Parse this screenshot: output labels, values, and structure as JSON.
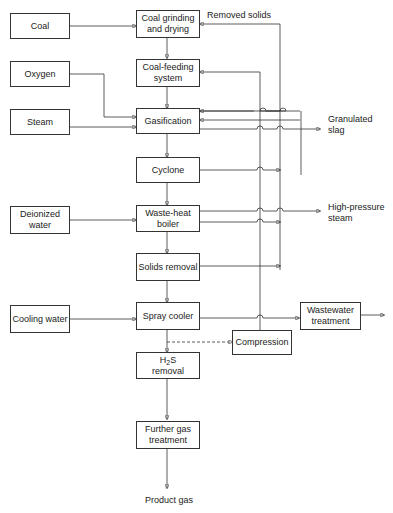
{
  "inputs": {
    "coal": "Coal",
    "oxygen": "Oxygen",
    "steam": "Steam",
    "deionized_water": "Deionized water",
    "cooling_water": "Cooling water"
  },
  "process": {
    "coal_grinding": "Coal grinding and drying",
    "coal_feeding": "Coal-feeding system",
    "gasification": "Gasification",
    "cyclone": "Cyclone",
    "waste_heat_boiler": "Waste-heat boiler",
    "solids_removal": "Solids removal",
    "spray_cooler": "Spray cooler",
    "h2s_removal_prefix": "H",
    "h2s_removal_sub": "2",
    "h2s_removal_suffix": "S",
    "h2s_removal_line2": "removal",
    "further_gas": "Further gas treatment",
    "compression": "Compression",
    "wastewater": "Wastewater treatment"
  },
  "outputs": {
    "removed_solids": "Removed solids",
    "granulated_slag": "Granulated slag",
    "high_pressure_steam": "High-pressure steam",
    "product_gas": "Product gas"
  }
}
